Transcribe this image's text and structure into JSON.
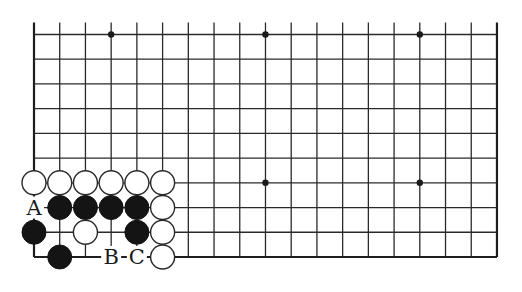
{
  "diagram": {
    "type": "go-board-partial",
    "columns": 19,
    "rows": 10,
    "open_top": true,
    "origin_x": 34,
    "origin_y": 34.5,
    "spacing_x": 25.72,
    "spacing_y": 24.72,
    "stone_radius": 12,
    "line_color": "#2a2a2a",
    "black_color": "#141414",
    "white_color": "#ffffff",
    "star_points": [
      {
        "col": 3,
        "row": 0
      },
      {
        "col": 9,
        "row": 0
      },
      {
        "col": 15,
        "row": 0
      },
      {
        "col": 9,
        "row": 6
      },
      {
        "col": 15,
        "row": 6
      }
    ],
    "stones": [
      {
        "color": "white",
        "col": 0,
        "row": 6
      },
      {
        "color": "white",
        "col": 1,
        "row": 6
      },
      {
        "color": "white",
        "col": 2,
        "row": 6
      },
      {
        "color": "white",
        "col": 3,
        "row": 6
      },
      {
        "color": "white",
        "col": 4,
        "row": 6
      },
      {
        "color": "white",
        "col": 5,
        "row": 6
      },
      {
        "color": "black",
        "col": 1,
        "row": 7
      },
      {
        "color": "black",
        "col": 2,
        "row": 7
      },
      {
        "color": "black",
        "col": 3,
        "row": 7
      },
      {
        "color": "black",
        "col": 4,
        "row": 7
      },
      {
        "color": "white",
        "col": 5,
        "row": 7
      },
      {
        "color": "black",
        "col": 0,
        "row": 8
      },
      {
        "color": "white",
        "col": 2,
        "row": 8
      },
      {
        "color": "black",
        "col": 4,
        "row": 8
      },
      {
        "color": "white",
        "col": 5,
        "row": 8
      },
      {
        "color": "black",
        "col": 1,
        "row": 9
      },
      {
        "color": "white",
        "col": 5,
        "row": 9
      }
    ],
    "labels": [
      {
        "text": "A",
        "col": 0,
        "row": 7
      },
      {
        "text": "B",
        "col": 3,
        "row": 9
      },
      {
        "text": "C",
        "col": 4,
        "row": 9
      }
    ]
  }
}
